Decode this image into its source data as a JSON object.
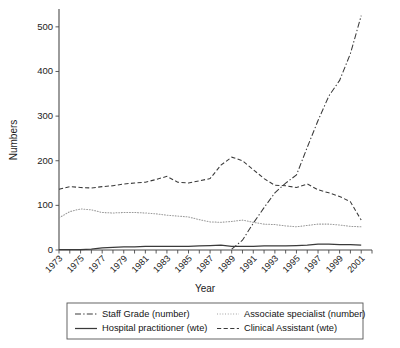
{
  "chart_data": {
    "type": "line",
    "title": "",
    "xlabel": "Year",
    "ylabel": "Numbers",
    "xlim": [
      1973,
      2002
    ],
    "ylim": [
      0,
      540
    ],
    "yticks": [
      0,
      100,
      200,
      300,
      400,
      500
    ],
    "xticks": [
      1973,
      1975,
      1977,
      1979,
      1981,
      1983,
      1985,
      1987,
      1989,
      1991,
      1993,
      1995,
      1997,
      1999,
      2001
    ],
    "x": [
      1973,
      1974,
      1975,
      1976,
      1977,
      1978,
      1979,
      1980,
      1981,
      1982,
      1983,
      1984,
      1985,
      1986,
      1987,
      1988,
      1989,
      1990,
      1991,
      1992,
      1993,
      1994,
      1995,
      1996,
      1997,
      1998,
      1999,
      2000,
      2001
    ],
    "grid": false,
    "legend_position": "below",
    "series": [
      {
        "name": "Staff Grade (number)",
        "style": "dash-dot",
        "values": [
          null,
          null,
          null,
          null,
          null,
          null,
          null,
          null,
          null,
          null,
          null,
          null,
          null,
          null,
          null,
          null,
          2,
          22,
          60,
          95,
          128,
          150,
          168,
          230,
          290,
          345,
          380,
          440,
          525
        ]
      },
      {
        "name": "Associate specialist (number)",
        "style": "dotted",
        "values": [
          72,
          86,
          92,
          90,
          84,
          83,
          84,
          84,
          83,
          81,
          78,
          76,
          74,
          68,
          63,
          62,
          64,
          67,
          62,
          58,
          57,
          54,
          52,
          55,
          58,
          58,
          56,
          53,
          52
        ]
      },
      {
        "name": "Hospital practitioner (wte)",
        "style": "solid",
        "values": [
          1,
          1,
          1,
          2,
          5,
          6,
          7,
          7,
          8,
          8,
          8,
          8,
          8,
          9,
          10,
          11,
          8,
          8,
          8,
          9,
          9,
          9,
          10,
          11,
          13,
          13,
          12,
          12,
          11
        ]
      },
      {
        "name": "Clinical Assistant (wte)",
        "style": "dashed",
        "values": [
          136,
          142,
          140,
          139,
          142,
          144,
          148,
          150,
          152,
          158,
          165,
          152,
          150,
          155,
          160,
          190,
          208,
          200,
          180,
          160,
          145,
          144,
          140,
          148,
          135,
          128,
          120,
          108,
          67
        ]
      }
    ]
  },
  "legend": {
    "entries": [
      {
        "label": "Staff Grade (number)",
        "style": "dash-dot"
      },
      {
        "label": "Associate specialist (number)",
        "style": "dotted"
      },
      {
        "label": "Hospital practitioner (wte)",
        "style": "solid"
      },
      {
        "label": "Clinical Assistant (wte)",
        "style": "dashed"
      }
    ]
  }
}
